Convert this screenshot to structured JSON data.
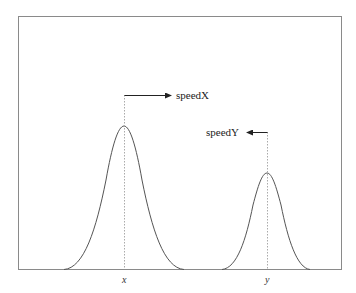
{
  "diagram": {
    "frame_color": "#8a8a8a",
    "curve_color": "#555555",
    "guide_color": "#aaaaaa",
    "arrow_color": "#222222",
    "peaks": [
      {
        "id": "x",
        "axis_label": "x",
        "arrow_label": "speedX",
        "arrow_direction": "right",
        "center_x": 124,
        "peak_y": 126,
        "half_width": 60
      },
      {
        "id": "y",
        "axis_label": "y",
        "arrow_label": "speedY",
        "arrow_direction": "left",
        "center_x": 267,
        "peak_y": 173,
        "half_width": 45
      }
    ]
  }
}
